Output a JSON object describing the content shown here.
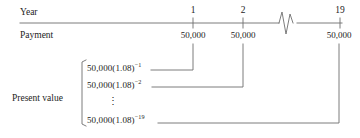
{
  "figure": {
    "type": "annuity-time-line-diagram",
    "row_labels": {
      "year": "Year",
      "payment": "Payment",
      "present_value": "Present value"
    },
    "timeline": {
      "periods": [
        {
          "year_label": "1",
          "payment_label": "50,000"
        },
        {
          "year_label": "2",
          "payment_label": "50,000"
        },
        {
          "year_label": "19",
          "payment_label": "50,000"
        }
      ],
      "break_symbol": "zigzag-axis-break"
    },
    "present_value_terms": [
      {
        "base": "50,000(1.08)",
        "exponent": "−1"
      },
      {
        "base": "50,000(1.08)",
        "exponent": "−2"
      },
      {
        "base": "50,000(1.08)",
        "exponent": "−19"
      }
    ],
    "ellipsis": "⋮",
    "colors": {
      "line": "#6e6e6e",
      "text": "#232323",
      "background": "#ffffff"
    }
  }
}
